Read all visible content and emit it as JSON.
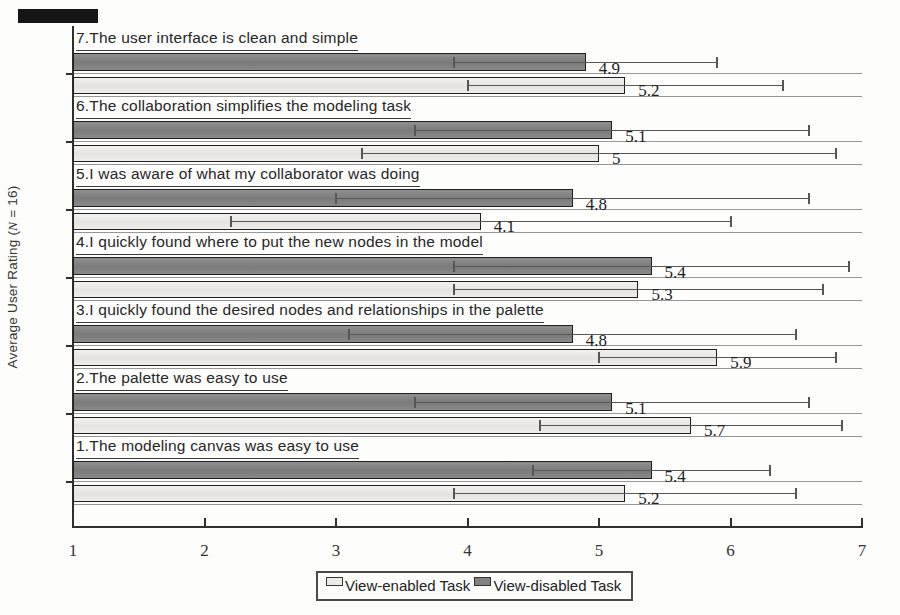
{
  "figure": {
    "ylabel_parts": {
      "prefix": "Average User Rating (",
      "math_n": "N",
      "suffix": " = 16)"
    },
    "legend": {
      "entries": [
        {
          "label": "View-enabled Task",
          "swatch": "light"
        },
        {
          "label": "View-disabled Task",
          "swatch": "dark"
        }
      ]
    },
    "colors": {
      "bar_light_fill": "#edece8",
      "bar_dark_fill": "#838383",
      "bar_border": "#1f1f1f",
      "axis": "#2f2f2f",
      "row_separator": "#979797",
      "error_bar": "#565656"
    }
  },
  "chart_data": {
    "type": "bar",
    "orientation": "horizontal",
    "title": "",
    "xlabel": "",
    "ylabel": "Average User Rating (N = 16)",
    "xlim": [
      1,
      7
    ],
    "x_ticks": [
      "1",
      "2",
      "3",
      "4",
      "5",
      "6",
      "7"
    ],
    "grid": "row-separator-lines",
    "legend_position": "bottom-center",
    "categories_top_to_bottom": [
      "7.The user interface is clean and simple",
      "6.The collaboration simplifies the modeling task",
      "5.I was aware of what my collaborator was doing",
      "4.I quickly found where to put the new nodes in the model",
      "3.I quickly found the desired nodes and relationships in the palette",
      "2.The palette was easy to use",
      "1.The modeling canvas was easy to use"
    ],
    "series": [
      {
        "name": "View-disabled Task",
        "style": "dark",
        "row_position": "top",
        "values": [
          4.9,
          5.1,
          4.8,
          5.4,
          4.8,
          5.1,
          5.4
        ],
        "value_labels": [
          "4.9",
          "5.1",
          "4.8",
          "5.4",
          "4.8",
          "5.1",
          "5.4"
        ],
        "errors_plus_minus": [
          1.0,
          1.5,
          1.8,
          1.5,
          1.7,
          1.5,
          0.9
        ]
      },
      {
        "name": "View-enabled Task",
        "style": "light",
        "row_position": "bottom",
        "values": [
          5.2,
          5.0,
          4.1,
          5.3,
          5.9,
          5.7,
          5.2
        ],
        "value_labels": [
          "5.2",
          "5",
          "4.1",
          "5.3",
          "5.9",
          "5.7",
          "5.2"
        ],
        "errors_plus_minus": [
          1.2,
          1.8,
          1.9,
          1.4,
          0.9,
          1.15,
          1.3
        ]
      }
    ]
  }
}
